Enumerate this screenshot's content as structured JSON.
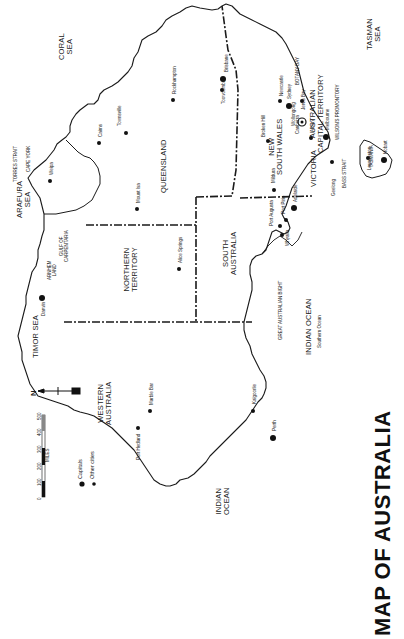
{
  "title": "MAP OF AUSTRALIA",
  "legend": {
    "capitals_label": "Capitals",
    "other_cities_label": "Other cities",
    "scale_ticks": [
      "0",
      "100",
      "200",
      "300",
      "400",
      "500"
    ],
    "scale_unit": "MILES",
    "north_label": "N"
  },
  "states": {
    "western_australia": [
      "WESTERN",
      "AUSTRALIA"
    ],
    "northern_territory": [
      "NORTHERN",
      "TERRITORY"
    ],
    "south_australia": [
      "SOUTH",
      "AUSTRALIA"
    ],
    "queensland": "QUEENSLAND",
    "new_south_wales": [
      "NEW",
      "SOUTH WALES"
    ],
    "victoria": "VICTORIA",
    "act": [
      "AUSTRALIAN",
      "CAPITAL TERRITORY"
    ],
    "tasmania": "TASMANIA"
  },
  "water": {
    "coral_sea": [
      "CORAL",
      "SEA"
    ],
    "tasman_sea": [
      "TASMAN",
      "SEA"
    ],
    "arafura_sea": [
      "ARAFURA",
      "SEA"
    ],
    "timor_sea": "TIMOR SEA",
    "indian_ocean_west": [
      "INDIAN",
      "OCEAN"
    ],
    "indian_ocean_south": "INDIAN OCEAN",
    "southern_ocean": "Southern Ocean",
    "great_australian_bight": "GREAT AUSTRALIAN BIGHT",
    "gulf_of_carpentaria": [
      "GULF OF",
      "CARPENTARIA"
    ],
    "torres_strait": "TORRES STRAIT",
    "bass_strait": [
      "BASS",
      "STRAIT"
    ],
    "botany_bay": "BOTANY BAY",
    "jervis_bay": "Jervis Bay"
  },
  "features": {
    "cape_york": "CAPE YORK",
    "arnhem_land": [
      "ARNHEM",
      "LAND"
    ],
    "wilsons_promontory": "WILSON'S PROMONTORY"
  },
  "cities": {
    "capitals": [
      "Darwin",
      "Brisbane",
      "Sydney",
      "Canberra",
      "Melbourne",
      "Adelaide",
      "Perth",
      "Hobart"
    ],
    "others": [
      "Weipa",
      "Cairns",
      "Townsville",
      "Rockhampton",
      "Toowoomba",
      "Mount Isa",
      "Alice Springs",
      "Broken Hill",
      "Mildura",
      "Port Augusta",
      "Port Pirie",
      "Whyalla",
      "Newcastle",
      "Wollongong",
      "Albury",
      "Geelong",
      "Launceston",
      "Kalgoorlie",
      "Marble Bar",
      "Port Hedland"
    ]
  }
}
